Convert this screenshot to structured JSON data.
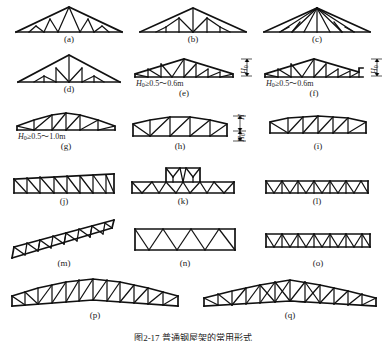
{
  "figure": {
    "title": "图2-17 普通钢屋架的常用形式",
    "count": 17,
    "rows": 6
  },
  "captions": {
    "a": "(a)",
    "b": "(b)",
    "c": "(c)",
    "d": "(d)",
    "e": "(e)",
    "f": "(f)",
    "g": "(g)",
    "h": "(h)",
    "i": "(i)",
    "j": "(j)",
    "k": "(k)",
    "l": "(l)",
    "m": "(m)",
    "n": "(n)",
    "o": "(o)",
    "p": "(p)",
    "q": "(q)"
  },
  "annotations": {
    "e_height": {
      "symbol": "H",
      "sub": "0",
      "text": "≥0.5～0.6m"
    },
    "f_height": {
      "symbol": "H",
      "sub": "0",
      "text": "≥0.5～0.6m"
    },
    "g_height": {
      "symbol": "H",
      "sub": "0",
      "text": "≥0.5～1.0m"
    },
    "e_dim": {
      "symbol": "H",
      "sub": "0"
    },
    "f_dim": {
      "symbol": "H",
      "sub": "0"
    },
    "h_dim_upper": {
      "symbol": "H",
      "sub": ""
    },
    "h_dim_lower": {
      "symbol": "H",
      "sub": "0"
    },
    "i_dim": {
      "symbol": "",
      "sub": ""
    }
  },
  "colors": {
    "line": "#111111",
    "background": "#ffffff",
    "text": "#1a1a1a"
  },
  "truss_types": {
    "a": "triangular truss with fink web",
    "b": "triangular truss with vertical posts",
    "c": "triangular fan truss",
    "d": "steep triangular truss",
    "e": "trapezoidal truss",
    "f": "trapezoidal truss with sloped end",
    "g": "low-pitch polygonal truss",
    "h": "near-parallel chord truss",
    "i": "cambered parallel chord truss",
    "j": "parallel chord truss with diagonal web",
    "k": "parallel chord truss with raised monitor",
    "l": "shallow parallel chord truss",
    "m": "inclined parallel chord truss",
    "n": "parallel chord warren truss",
    "o": "shallow warren truss",
    "p": "long-span polygonal truss",
    "q": "long-span polygonal truss with dense web"
  }
}
